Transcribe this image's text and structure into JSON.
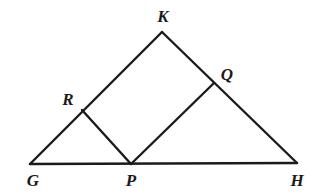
{
  "figure": {
    "canvas": {
      "width": 316,
      "height": 196
    },
    "stroke_color": "#1b1b1b",
    "background_color": "#ffffff",
    "stroke_width": 2.4,
    "points": {
      "G": {
        "x": 30,
        "y": 164
      },
      "P": {
        "x": 131,
        "y": 164
      },
      "H": {
        "x": 297,
        "y": 163
      },
      "K": {
        "x": 162,
        "y": 32
      },
      "R": {
        "x": 82,
        "y": 110
      },
      "Q": {
        "x": 214,
        "y": 83
      }
    },
    "segments": [
      {
        "name": "base-GH",
        "from": "G",
        "to": "H"
      },
      {
        "name": "side-GK",
        "from": "G",
        "to": "K"
      },
      {
        "name": "side-KH",
        "from": "K",
        "to": "H"
      },
      {
        "name": "chord-RP",
        "from": "R",
        "to": "P"
      },
      {
        "name": "chord-PQ",
        "from": "P",
        "to": "Q"
      }
    ],
    "labels": [
      {
        "name": "label-K",
        "text": "K",
        "x": 163,
        "y": 16
      },
      {
        "name": "label-Q",
        "text": "Q",
        "x": 227,
        "y": 74
      },
      {
        "name": "label-R",
        "text": "R",
        "x": 68,
        "y": 99
      },
      {
        "name": "label-G",
        "text": "G",
        "x": 33,
        "y": 180
      },
      {
        "name": "label-P",
        "text": "P",
        "x": 131,
        "y": 180
      },
      {
        "name": "label-H",
        "text": "H",
        "x": 297,
        "y": 180
      }
    ]
  }
}
